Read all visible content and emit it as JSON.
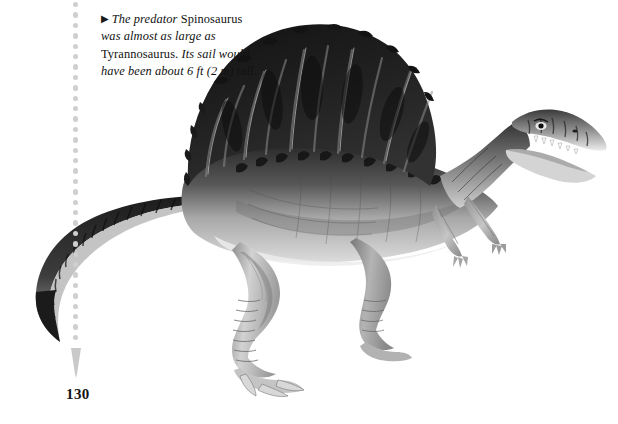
{
  "page": {
    "background_color": "#ffffff",
    "page_number": "130",
    "width": 618,
    "height": 424
  },
  "caption": {
    "bullet_glyph": "▶",
    "segments": [
      {
        "text": "The predator ",
        "style": "italic"
      },
      {
        "text": "Spinosaurus",
        "style": "roman"
      },
      {
        "text": " was almost as large as ",
        "style": "italic"
      },
      {
        "text": "Tyrannosaurus.",
        "style": "roman"
      },
      {
        "text": " Its sail would have been about 6 ft (2 m) tall.",
        "style": "italic"
      }
    ],
    "full_text": "▶ The predator Spinosaurus was almost as large as Tyrannosaurus. Its sail would have been about 6 ft (2 m) tall.",
    "text_color": "#121212"
  },
  "leader_line": {
    "dot_color": "#cfcfcf",
    "dot_count": 33,
    "dot_spacing": 10.4,
    "arrowhead_color": "#c9c9c9"
  },
  "illustration": {
    "subject": "spinosaurus-dinosaur",
    "description": "Grayscale painted Spinosaurus in right profile with tall dorsal sail, long curving tail, two hind legs, two small forelimbs and elongated crocodile-like snout",
    "palette": {
      "sail_dark": "#171717",
      "sail_mid": "#2e2e2e",
      "body_dark": "#3b3b3b",
      "body_mid": "#8e8e8e",
      "body_light": "#c8c8c8",
      "belly_highlight": "#e6e6e6",
      "tail_dark": "#222222",
      "outline": "#5a5a5a"
    }
  }
}
